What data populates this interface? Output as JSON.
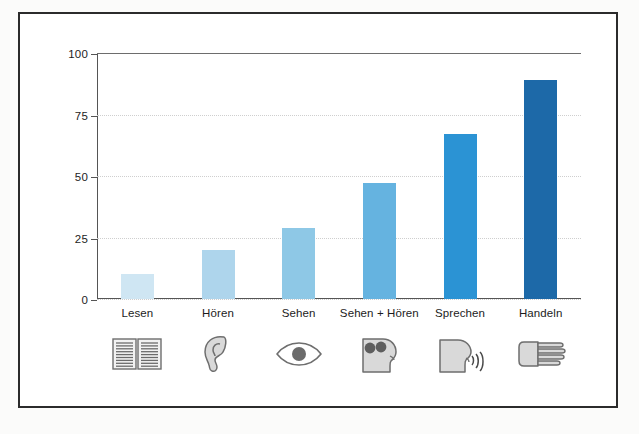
{
  "chart_data": {
    "type": "bar",
    "title": "",
    "subtitle": "",
    "xlabel": "",
    "ylabel": "",
    "categories": [
      "Lesen",
      "Hören",
      "Sehen",
      "Sehen + Hören",
      "Sprechen",
      "Handeln"
    ],
    "values": [
      10,
      20,
      29,
      47,
      67,
      89
    ],
    "ylim": [
      0,
      100
    ],
    "yticks": [
      0,
      25,
      50,
      75,
      100
    ],
    "ytick_labels": [
      "0",
      "25",
      "50",
      "75",
      "100"
    ],
    "grid": true,
    "grid_style": "dotted-horizontal",
    "legend": "none",
    "bar_colors": [
      "#cfe6f3",
      "#aed5ec",
      "#8ec8e6",
      "#65b3e0",
      "#2b93d4",
      "#1d69a8"
    ],
    "icons": [
      "open-book-icon",
      "ear-icon",
      "eye-icon",
      "head-seeing-hearing-icon",
      "head-speaking-icon",
      "hand-icon"
    ]
  },
  "frame": {
    "border_color": "#2b2b2b",
    "background": "#ffffff"
  },
  "axis": {
    "line_color": "#555555",
    "gridline_color": "#cfcfcf"
  }
}
